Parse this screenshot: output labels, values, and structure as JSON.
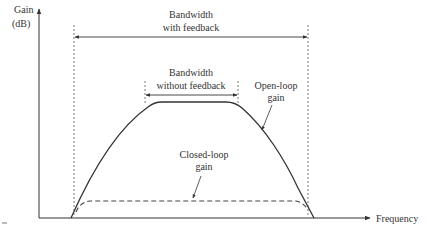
{
  "diagram": {
    "y_axis_label_line1": "Gain",
    "y_axis_label_line2": "(dB)",
    "x_axis_label": "Frequency",
    "bw_feedback_line1": "Bandwidth",
    "bw_feedback_line2": "with feedback",
    "bw_nofeedback_line1": "Bandwidth",
    "bw_nofeedback_line2": "without feedback",
    "open_loop_line1": "Open-loop",
    "open_loop_line2": "gain",
    "closed_loop_line1": "Closed-loop",
    "closed_loop_line2": "gain",
    "colors": {
      "line": "#333333",
      "background": "#ffffff"
    }
  }
}
